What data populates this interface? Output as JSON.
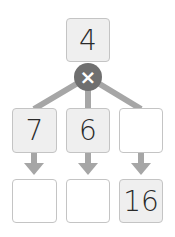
{
  "diagram": {
    "type": "multiplication-factor-tree",
    "colors": {
      "connector": "#a6a6a6",
      "operator_bg": "#6f6f6f",
      "filled_box": "#efefef",
      "empty_box": "#ffffff",
      "border": "#c4c4c4"
    },
    "top": {
      "value": "4"
    },
    "operator": {
      "symbol": "×",
      "name": "multiply"
    },
    "factors": [
      {
        "value": "7"
      },
      {
        "value": "6"
      },
      {
        "value": ""
      }
    ],
    "results": [
      {
        "value": ""
      },
      {
        "value": ""
      },
      {
        "value": "16"
      }
    ]
  }
}
